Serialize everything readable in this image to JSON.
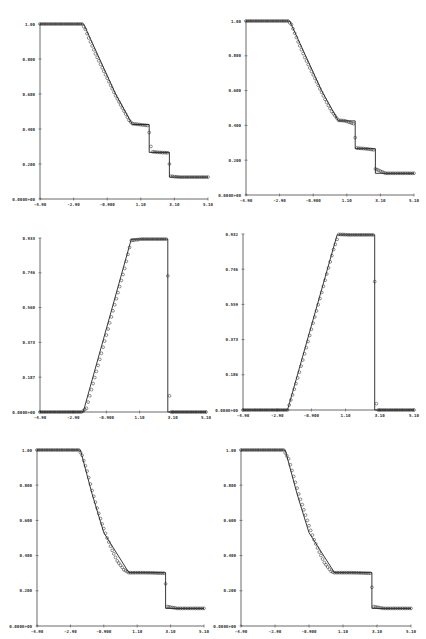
{
  "chart_data": [
    {
      "type": "line",
      "panel": "top-left",
      "title": "",
      "xlabel": "",
      "ylabel": "",
      "xlim": [
        -4.9,
        5.1
      ],
      "ylim": [
        0,
        1.0
      ],
      "x_ticks": [
        "-4.90",
        "-2.90",
        "-0.900",
        "1.10",
        "3.10",
        "5.10"
      ],
      "y_ticks": [
        "0.000E+00",
        "0.200",
        "0.400",
        "0.600",
        "0.800",
        "1.00"
      ],
      "series": [
        {
          "name": "exact",
          "style": "line",
          "x": [
            -4.9,
            -2.3,
            -0.4,
            0.6,
            1.6,
            1.6,
            2.8,
            2.8,
            5.1
          ],
          "y": [
            1.0,
            1.0,
            0.6,
            0.426,
            0.426,
            0.266,
            0.266,
            0.125,
            0.125
          ]
        },
        {
          "name": "numerical",
          "style": "circles",
          "x": [
            -4.9,
            -2.4,
            -2.2,
            -2.0,
            -1.6,
            -1.2,
            -0.8,
            -0.4,
            0.0,
            0.4,
            0.6,
            1.0,
            1.5,
            1.6,
            1.7,
            1.8,
            2.2,
            2.7,
            2.8,
            2.9,
            3.4,
            4.0,
            5.1
          ],
          "y": [
            1.0,
            1.0,
            0.97,
            0.92,
            0.83,
            0.75,
            0.67,
            0.59,
            0.52,
            0.45,
            0.43,
            0.426,
            0.42,
            0.38,
            0.3,
            0.27,
            0.266,
            0.264,
            0.2,
            0.13,
            0.125,
            0.125,
            0.125
          ]
        }
      ]
    },
    {
      "type": "line",
      "panel": "top-right",
      "xlim": [
        -4.9,
        5.1
      ],
      "ylim": [
        0,
        1.0
      ],
      "x_ticks": [
        "-4.90",
        "-2.90",
        "-0.900",
        "1.10",
        "3.10",
        "5.10"
      ],
      "y_ticks": [
        "0.000E+00",
        "0.200",
        "0.400",
        "0.600",
        "0.800",
        "1.00"
      ],
      "series": [
        {
          "name": "exact",
          "style": "line",
          "x": [
            -4.9,
            -2.3,
            -0.4,
            0.6,
            1.6,
            1.6,
            2.8,
            2.8,
            5.1
          ],
          "y": [
            1.0,
            1.0,
            0.6,
            0.426,
            0.426,
            0.266,
            0.266,
            0.125,
            0.125
          ]
        },
        {
          "name": "numerical",
          "style": "circles",
          "x": [
            -4.9,
            -2.4,
            -2.2,
            -1.8,
            -1.4,
            -1.0,
            -0.6,
            -0.2,
            0.2,
            0.6,
            1.0,
            1.5,
            1.6,
            1.7,
            2.2,
            2.7,
            2.8,
            3.4,
            5.1
          ],
          "y": [
            1.0,
            1.0,
            0.98,
            0.88,
            0.79,
            0.71,
            0.63,
            0.55,
            0.48,
            0.43,
            0.426,
            0.41,
            0.33,
            0.27,
            0.266,
            0.26,
            0.15,
            0.125,
            0.125
          ]
        }
      ]
    },
    {
      "type": "line",
      "panel": "middle-left",
      "xlim": [
        -4.9,
        5.1
      ],
      "ylim": [
        0,
        0.933
      ],
      "x_ticks": [
        "-4.90",
        "-2.90",
        "-0.900",
        "1.10",
        "3.10",
        "5.10"
      ],
      "y_ticks": [
        "0.000E+00",
        "0.187",
        "0.373",
        "0.560",
        "0.746",
        "0.933"
      ],
      "series": [
        {
          "name": "exact",
          "style": "line",
          "x": [
            -4.9,
            -2.3,
            0.6,
            2.8,
            2.8,
            5.1
          ],
          "y": [
            0.0,
            0.0,
            0.927,
            0.927,
            0.0,
            0.0
          ]
        },
        {
          "name": "numerical",
          "style": "circles",
          "x": [
            -4.9,
            -2.4,
            -2.1,
            -1.8,
            -1.4,
            -1.0,
            -0.6,
            -0.2,
            0.2,
            0.6,
            1.2,
            2.7,
            2.8,
            2.85,
            3.0,
            5.1
          ],
          "y": [
            0.0,
            0.0,
            0.02,
            0.12,
            0.25,
            0.38,
            0.51,
            0.64,
            0.77,
            0.92,
            0.927,
            0.927,
            0.73,
            0.13,
            0.0,
            0.0
          ]
        }
      ]
    },
    {
      "type": "line",
      "panel": "middle-right",
      "xlim": [
        -4.9,
        5.1
      ],
      "ylim": [
        0,
        0.932
      ],
      "x_ticks": [
        "-4.90",
        "-2.90",
        "-0.900",
        "1.10",
        "3.10",
        "5.10"
      ],
      "y_ticks": [
        "0.000E+00",
        "0.186",
        "0.373",
        "0.559",
        "0.746",
        "0.932"
      ],
      "series": [
        {
          "name": "exact",
          "style": "line",
          "x": [
            -4.9,
            -2.3,
            0.6,
            2.8,
            2.8,
            5.1
          ],
          "y": [
            0.0,
            0.0,
            0.927,
            0.927,
            0.0,
            0.0
          ]
        },
        {
          "name": "numerical",
          "style": "circles",
          "x": [
            -4.9,
            -2.3,
            -2.0,
            -1.6,
            -1.2,
            -0.8,
            -0.4,
            0.0,
            0.4,
            0.7,
            1.4,
            2.7,
            2.8,
            2.85,
            3.0,
            5.1
          ],
          "y": [
            0.0,
            0.0,
            0.08,
            0.2,
            0.33,
            0.46,
            0.59,
            0.72,
            0.85,
            0.93,
            0.927,
            0.927,
            0.68,
            0.05,
            0.0,
            0.0
          ]
        }
      ]
    },
    {
      "type": "line",
      "panel": "bottom-left",
      "xlim": [
        -4.9,
        5.1
      ],
      "ylim": [
        0,
        1.0
      ],
      "x_ticks": [
        "-4.90",
        "-2.90",
        "-0.900",
        "1.10",
        "3.10",
        "5.10"
      ],
      "y_ticks": [
        "0.000E+00",
        "0.200",
        "0.400",
        "0.600",
        "0.800",
        "1.00"
      ],
      "series": [
        {
          "name": "exact",
          "style": "line",
          "x": [
            -4.9,
            -2.3,
            -1.6,
            -0.9,
            0.6,
            2.8,
            2.8,
            5.1
          ],
          "y": [
            1.0,
            1.0,
            0.75,
            0.53,
            0.303,
            0.303,
            0.1,
            0.1
          ]
        },
        {
          "name": "numerical",
          "style": "circles",
          "x": [
            -4.9,
            -2.4,
            -2.2,
            -1.9,
            -1.6,
            -1.3,
            -1.0,
            -0.7,
            -0.4,
            -0.1,
            0.3,
            0.6,
            1.5,
            2.7,
            2.8,
            2.9,
            3.5,
            5.1
          ],
          "y": [
            1.0,
            1.0,
            0.97,
            0.88,
            0.77,
            0.67,
            0.58,
            0.5,
            0.43,
            0.37,
            0.32,
            0.303,
            0.303,
            0.3,
            0.24,
            0.11,
            0.1,
            0.1
          ]
        }
      ]
    },
    {
      "type": "line",
      "panel": "bottom-right",
      "xlim": [
        -4.9,
        5.1
      ],
      "ylim": [
        0,
        1.0
      ],
      "x_ticks": [
        "-4.90",
        "-2.90",
        "-0.900",
        "1.10",
        "3.10",
        "5.10"
      ],
      "y_ticks": [
        "0.000E+00",
        "0.200",
        "0.400",
        "0.600",
        "0.800",
        "1.00"
      ],
      "series": [
        {
          "name": "exact",
          "style": "line",
          "x": [
            -4.9,
            -2.3,
            -1.6,
            -0.9,
            0.6,
            2.8,
            2.8,
            5.1
          ],
          "y": [
            1.0,
            1.0,
            0.75,
            0.53,
            0.303,
            0.303,
            0.1,
            0.1
          ]
        },
        {
          "name": "numerical",
          "style": "circles",
          "x": [
            -4.9,
            -2.4,
            -2.1,
            -1.8,
            -1.5,
            -1.2,
            -0.9,
            -0.6,
            -0.3,
            0.0,
            0.4,
            0.6,
            1.5,
            2.7,
            2.8,
            2.9,
            3.5,
            5.1
          ],
          "y": [
            1.0,
            1.0,
            0.95,
            0.85,
            0.75,
            0.66,
            0.57,
            0.49,
            0.42,
            0.36,
            0.31,
            0.303,
            0.303,
            0.3,
            0.22,
            0.11,
            0.1,
            0.1
          ]
        }
      ]
    }
  ]
}
